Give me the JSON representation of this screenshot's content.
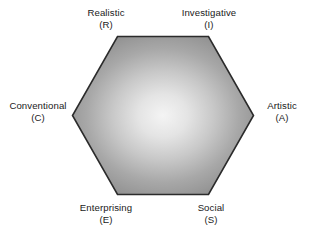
{
  "figure": {
    "name": "riasec-hexagon",
    "type": "diagram",
    "shape": "hexagon",
    "background_color": "#ffffff",
    "outline_color": "#2b2b2b",
    "fill_center_color": "#f2f2f2",
    "fill_edge_color": "#8a8a8a",
    "text_color": "#1a1a1a"
  },
  "vertices": [
    {
      "id": "realistic",
      "position": "top-left",
      "name": "Realistic",
      "code": "(R)",
      "letter": "R"
    },
    {
      "id": "investigative",
      "position": "top-right",
      "name": "Investigative",
      "code": "(I)",
      "letter": "I"
    },
    {
      "id": "artistic",
      "position": "right",
      "name": "Artistic",
      "code": "(A)",
      "letter": "A"
    },
    {
      "id": "social",
      "position": "bottom-right",
      "name": "Social",
      "code": "(S)",
      "letter": "S"
    },
    {
      "id": "enterprising",
      "position": "bottom-left",
      "name": "Enterprising",
      "code": "(E)",
      "letter": "E"
    },
    {
      "id": "conventional",
      "position": "left",
      "name": "Conventional",
      "code": "(C)",
      "letter": "C"
    }
  ]
}
